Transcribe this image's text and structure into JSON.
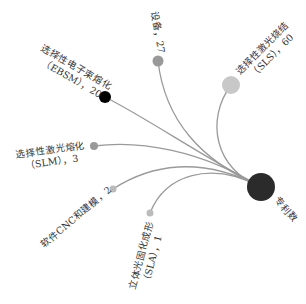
{
  "diagram": {
    "type": "radial-tree",
    "root": {
      "label": "专利数",
      "x": 261,
      "y": 187,
      "r": 14,
      "color": "#2b2b2b",
      "label_x": 274,
      "label_y": 200,
      "label_rot": 50
    },
    "children": [
      {
        "name": "设备",
        "value": 27,
        "label_line1": "设备，27",
        "label_line2": "",
        "x": 158,
        "y": 61,
        "r": 5.5,
        "color": "#999999",
        "curve": "M261,187 C200,160 165,120 158,61",
        "label_x": 151,
        "label_y": 12,
        "label_rot": 80
      },
      {
        "name": "选择性激光烧结（SLS）",
        "value": 60,
        "label_line1": "选择性激光烧结",
        "label_line2": "（SLS），60",
        "x": 231,
        "y": 85,
        "r": 9,
        "color": "#c8c8c8",
        "curve": "M261,187 C215,170 205,120 231,85",
        "label_x": 240,
        "label_y": 75,
        "label_rot": -45
      },
      {
        "name": "选择性电子束熔化（EBSM）",
        "value": 20,
        "label_line1": "选择性电子束熔化",
        "label_line2": "（EBSM），20",
        "x": 105,
        "y": 97,
        "r": 6,
        "color": "#000000",
        "curve": "M261,187 C200,155 150,120 105,97",
        "label_x": 40,
        "label_y": 50,
        "label_rot": 30
      },
      {
        "name": "选择性激光熔化（SLM）",
        "value": 3,
        "label_line1": "选择性激光熔化",
        "label_line2": "（SLM），3",
        "x": 94,
        "y": 146,
        "r": 4,
        "color": "#999999",
        "curve": "M261,187 C200,150 140,140 94,146",
        "label_x": 16,
        "label_y": 158,
        "label_rot": -8
      },
      {
        "name": "软件CNC和建模",
        "value": 2,
        "label_line1": "软件CNC和建模，2",
        "label_line2": "",
        "x": 113,
        "y": 189,
        "r": 3.5,
        "color": "#bbbbbb",
        "curve": "M261,187 C200,155 150,165 113,189",
        "label_x": 44,
        "label_y": 248,
        "label_rot": -40
      },
      {
        "name": "立体光固化成形（SLA）",
        "value": 1,
        "label_line1": "立体光固化成形",
        "label_line2": "（SLA），1",
        "x": 150,
        "y": 213,
        "r": 3.5,
        "color": "#bbbbbb",
        "curve": "M261,187 C210,160 165,175 150,213",
        "label_x": 135,
        "label_y": 290,
        "label_rot": -75
      }
    ],
    "link_color": "#9a9a9a"
  }
}
